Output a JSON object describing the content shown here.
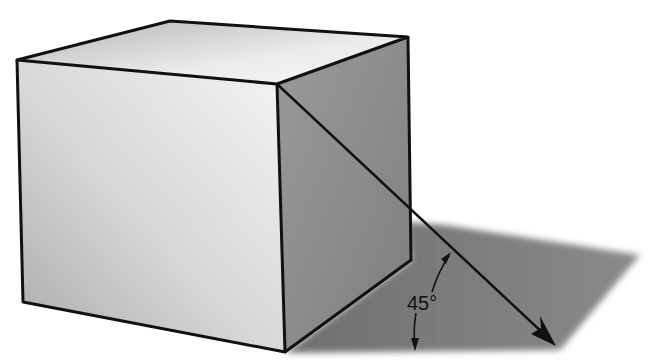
{
  "diagram": {
    "angle_label": "45°",
    "colors": {
      "outline": "#111111",
      "front_face_light": "#f2f2f2",
      "front_face_dark": "#a8a8a8",
      "top_face_light": "#f0f0f0",
      "top_face_dark": "#b5b5b5",
      "side_face": "#8c8c8c",
      "shadow": "#7a7a7a",
      "background": "#ffffff"
    },
    "elements": [
      "cube",
      "cast-shadow",
      "light-ray-arrow",
      "angle-arc-arrows",
      "angle-label"
    ]
  }
}
